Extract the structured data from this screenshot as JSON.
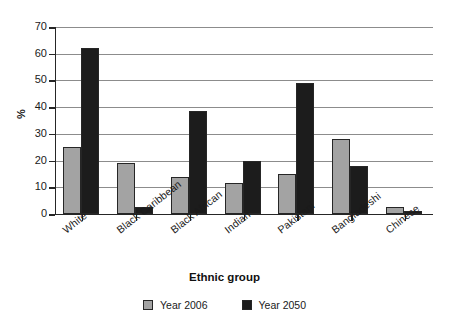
{
  "chart_data": {
    "type": "bar",
    "title": "",
    "xlabel": "Ethnic group",
    "ylabel": "%",
    "ylim": [
      0,
      70
    ],
    "yticks": [
      0,
      10,
      20,
      30,
      40,
      50,
      60,
      70
    ],
    "grid": true,
    "legend_position": "bottom",
    "categories": [
      "White",
      "Black Caribbean",
      "Black African",
      "Indian",
      "Pakistani",
      "Bangladeshi",
      "Chinese"
    ],
    "series": [
      {
        "name": "Year 2006",
        "color": "#a3a3a3",
        "values": [
          25,
          19,
          14,
          11.5,
          15,
          28,
          2.5
        ]
      },
      {
        "name": "Year 2050",
        "color": "#1c1c1c",
        "values": [
          62,
          2.5,
          38.5,
          20,
          49,
          18,
          1
        ]
      }
    ]
  },
  "axes": {
    "y_title": "%",
    "x_title": "Ethnic group",
    "y_tick_labels": [
      "0",
      "10",
      "20",
      "30",
      "40",
      "50",
      "60",
      "70"
    ],
    "x_tick_labels": [
      "White",
      "Black Caribbean",
      "Black African",
      "Indian",
      "Pakistani",
      "Bangladeshi",
      "Chinese"
    ]
  },
  "legend": {
    "items": [
      {
        "label": "Year 2006",
        "color": "#a3a3a3"
      },
      {
        "label": "Year 2050",
        "color": "#1c1c1c"
      }
    ]
  },
  "colors": {
    "series_2006": "#a3a3a3",
    "series_2050": "#1c1c1c",
    "axis": "#262626",
    "gridline": "#8c8c8c",
    "background": "#ffffff"
  }
}
